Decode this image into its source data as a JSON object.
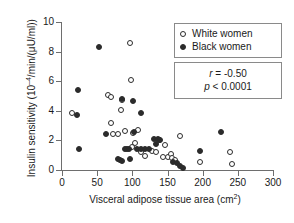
{
  "chart_data": {
    "type": "scatter",
    "title": "",
    "xlabel": "Visceral adipose tissue area (cm2)",
    "xlabel_base": "Visceral adipose tissue area (cm",
    "xlabel_sup": "2",
    "xlabel_tail": ")",
    "ylabel": "Insulin sensitivity (10-4/min/(μU/ml))",
    "ylabel_base": "Insulin sensitivity (10",
    "ylabel_sup": "–4",
    "ylabel_tail": "/min/(μU/ml))",
    "xlim": [
      0,
      300
    ],
    "ylim": [
      0,
      10
    ],
    "xticks": [
      0,
      50,
      100,
      150,
      200,
      250,
      300
    ],
    "yticks": [
      0,
      2,
      4,
      6,
      8,
      10
    ],
    "grid": false,
    "legend_position": "top-right",
    "marker_color": "#2b2b2b",
    "axis_color": "#6e6e6e",
    "series": [
      {
        "name": "White women",
        "marker": "open-circle",
        "points": [
          [
            14,
            3.85
          ],
          [
            65,
            5.05
          ],
          [
            70,
            4.9
          ],
          [
            69,
            3.15
          ],
          [
            72,
            2.45
          ],
          [
            79,
            2.45
          ],
          [
            84,
            4.05
          ],
          [
            86,
            4.75
          ],
          [
            90,
            2.65
          ],
          [
            97,
            8.55
          ],
          [
            98,
            6.1
          ],
          [
            101,
            2.5
          ],
          [
            104,
            1.85
          ],
          [
            99,
            1.55
          ],
          [
            108,
            2.7
          ],
          [
            112,
            1.25
          ],
          [
            118,
            0.95
          ],
          [
            128,
            1.3
          ],
          [
            133,
            1.25
          ],
          [
            138,
            2.05
          ],
          [
            143,
            0.85
          ],
          [
            147,
            1.7
          ],
          [
            150,
            0.85
          ],
          [
            155,
            1.05
          ],
          [
            157,
            0.8
          ],
          [
            160,
            0.65
          ],
          [
            168,
            2.3
          ],
          [
            196,
            0.55
          ],
          [
            239,
            1.25
          ],
          [
            241,
            0.4
          ]
        ]
      },
      {
        "name": "Black women",
        "marker": "filled-circle",
        "points": [
          [
            22,
            3.75
          ],
          [
            23,
            5.4
          ],
          [
            24,
            1.45
          ],
          [
            53,
            8.3
          ],
          [
            63,
            2.45
          ],
          [
            79,
            0.75
          ],
          [
            82,
            0.7
          ],
          [
            85,
            4.8
          ],
          [
            86,
            0.6
          ],
          [
            89,
            1.45
          ],
          [
            93,
            1.45
          ],
          [
            95,
            1.4
          ],
          [
            96,
            0.75
          ],
          [
            101,
            4.65
          ],
          [
            103,
            2.6
          ],
          [
            107,
            1.45
          ],
          [
            112,
            3.85
          ],
          [
            113,
            1.45
          ],
          [
            118,
            1.45
          ],
          [
            123,
            1.45
          ],
          [
            131,
            2.1
          ],
          [
            134,
            1.75
          ],
          [
            136,
            2.1
          ],
          [
            140,
            2.0
          ],
          [
            158,
            0.55
          ],
          [
            163,
            0.45
          ],
          [
            168,
            0.3
          ],
          [
            172,
            0.15
          ],
          [
            196,
            1.3
          ],
          [
            226,
            2.6
          ]
        ]
      }
    ],
    "annotations": {
      "r_label": "r",
      "r_value": " = -0.50",
      "p_label": "p",
      "p_value": " < 0.0001"
    }
  },
  "legend": {
    "items": [
      {
        "label": "White women",
        "marker": "open-circle"
      },
      {
        "label": "Black women",
        "marker": "filled-circle"
      }
    ]
  }
}
